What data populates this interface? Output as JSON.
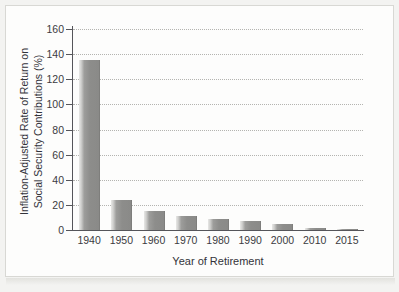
{
  "figure": {
    "y_axis_title_line1": "Inflation-Adjusted Rate of Return on",
    "y_axis_title_line2": "Social Security Contributions (%)",
    "x_axis_title": "Year of Retirement"
  },
  "colors": {
    "bar_fill": "#8d8d8b",
    "bar_highlight": "#e8e8e6",
    "axis": "#55555a",
    "gridline": "#b4b4b0",
    "text": "#33333a",
    "page_background": "#f3f3f1",
    "plot_background": "#fdfdfc"
  },
  "chart_data": {
    "type": "bar",
    "title": "",
    "subtitle": "",
    "xlabel": "Year of Retirement",
    "ylabel": "Inflation-Adjusted Rate of Return on Social Security Contributions (%)",
    "categories": [
      "1940",
      "1950",
      "1960",
      "1970",
      "1980",
      "1990",
      "2000",
      "2010",
      "2015"
    ],
    "values": [
      135,
      24,
      15,
      11,
      9,
      7,
      5,
      1.5,
      1
    ],
    "ylim": [
      0,
      160
    ],
    "ytick_labels": [
      "0",
      "20",
      "40",
      "60",
      "80",
      "100",
      "120",
      "140",
      "160"
    ],
    "ytick_values": [
      0,
      20,
      40,
      60,
      80,
      100,
      120,
      140,
      160
    ],
    "grid": "horizontal-dotted",
    "legend": "none",
    "legend_position": "none"
  }
}
